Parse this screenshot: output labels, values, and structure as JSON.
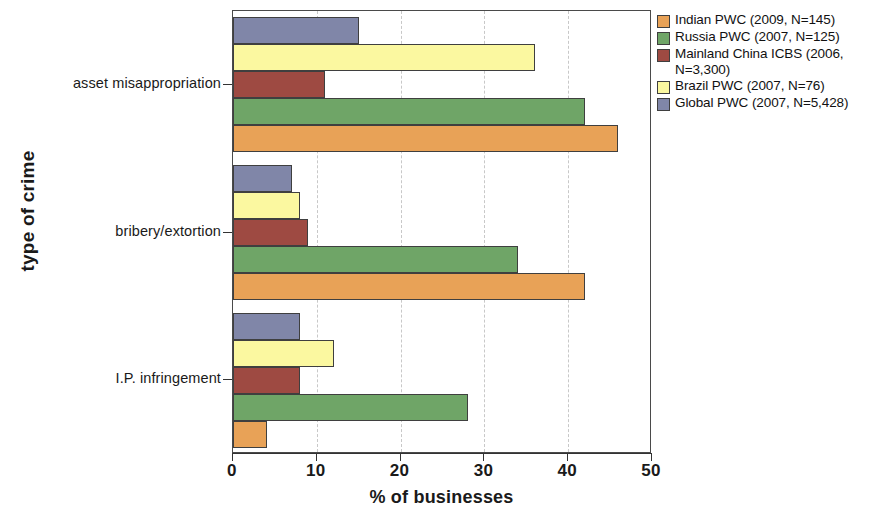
{
  "chart_data": {
    "type": "bar",
    "orientation": "horizontal",
    "title": "",
    "xlabel": "% of businesses",
    "ylabel": "type of crime",
    "xlim": [
      0,
      50
    ],
    "xticks": [
      0,
      10,
      20,
      30,
      40,
      50
    ],
    "grid": true,
    "grid_style": "dashed vertical",
    "legend_position": "right",
    "categories": [
      "asset misappropriation",
      "bribery/extortion",
      "I.P. infringement"
    ],
    "series": [
      {
        "name": "Indian PWC (2009, N=145)",
        "color": "#e8a257",
        "values": [
          46,
          42,
          4
        ]
      },
      {
        "name": "Russia PWC (2007, N=125)",
        "color": "#6fa567",
        "values": [
          42,
          34,
          28
        ]
      },
      {
        "name": "Mainland China ICBS (2006,\nN=3,300)",
        "color": "#9e4a42",
        "values": [
          11,
          9,
          8
        ]
      },
      {
        "name": "Brazil PWC (2007, N=76)",
        "color": "#fbf8a0",
        "values": [
          36,
          8,
          12
        ]
      },
      {
        "name": "Global PWC (2007, N=5,428)",
        "color": "#8086a8",
        "values": [
          15,
          7,
          8
        ]
      }
    ]
  },
  "axis": {
    "x_tick_labels": [
      "0",
      "10",
      "20",
      "30",
      "40",
      "50"
    ],
    "x_title": "% of businesses",
    "y_title": "type of crime",
    "y_tick_labels": [
      "asset misappropriation",
      "bribery/extortion",
      "I.P. infringement"
    ]
  },
  "legend": {
    "entries": [
      "Indian PWC (2009, N=145)",
      "Russia PWC (2007, N=125)",
      "Mainland China ICBS (2006,\nN=3,300)",
      "Brazil PWC (2007, N=76)",
      "Global PWC (2007, N=5,428)"
    ]
  }
}
